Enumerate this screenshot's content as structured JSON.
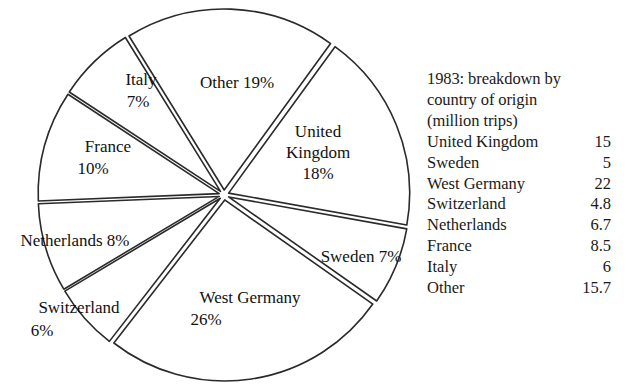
{
  "chart_data": {
    "type": "pie",
    "title": "1983: breakdown by country of origin (million trips)",
    "unit": "million trips",
    "year": "1983",
    "categories": [
      "United Kingdom",
      "Sweden",
      "West Germany",
      "Switzerland",
      "Netherlands",
      "France",
      "Italy",
      "Other"
    ],
    "values": [
      15,
      5,
      22,
      4.8,
      6.7,
      8.5,
      6,
      15.7
    ],
    "percentages": [
      18,
      7,
      26,
      6,
      8,
      10,
      7,
      19
    ],
    "value_labels": [
      "15",
      "5",
      "22",
      "4.8",
      "6.7",
      "8.5",
      "6",
      "15.7"
    ],
    "legend_position": "right",
    "exploded": true,
    "slice_label_text": [
      "United Kingdom 18%",
      "Sweden 7%",
      "West Germany 26%",
      "Switzerland 6%",
      "Netherlands 8%",
      "France 10%",
      "Italy 7%",
      "Other 19%"
    ]
  },
  "pie": {
    "slices": [
      {
        "name": "united-kingdom",
        "label_line1": "United",
        "label_line2": "Kingdom",
        "label_line3": "18%"
      },
      {
        "name": "sweden",
        "label_line1": "Sweden 7%",
        "label_line2": "",
        "label_line3": ""
      },
      {
        "name": "west-germany",
        "label_line1": "West Germany",
        "label_line2": "26%",
        "label_line3": ""
      },
      {
        "name": "switzerland",
        "label_line1": "Switzerland",
        "label_line2": "6%",
        "label_line3": ""
      },
      {
        "name": "netherlands",
        "label_line1": "Netherlands 8%",
        "label_line2": "",
        "label_line3": ""
      },
      {
        "name": "france",
        "label_line1": "France",
        "label_line2": "10%",
        "label_line3": ""
      },
      {
        "name": "italy",
        "label_line1": "Italy",
        "label_line2": "7%",
        "label_line3": ""
      },
      {
        "name": "other",
        "label_line1": "Other 19%",
        "label_line2": "",
        "label_line3": ""
      }
    ]
  },
  "legend": {
    "title": "1983: breakdown by\ncountry of origin\n(million trips)",
    "rows": [
      {
        "country": "United Kingdom",
        "value": "15"
      },
      {
        "country": "Sweden",
        "value": "5"
      },
      {
        "country": "West Germany",
        "value": "22"
      },
      {
        "country": "Switzerland",
        "value": "4.8"
      },
      {
        "country": "Netherlands",
        "value": "6.7"
      },
      {
        "country": "France",
        "value": "8.5"
      },
      {
        "country": "Italy",
        "value": "6"
      },
      {
        "country": "Other",
        "value": "15.7"
      }
    ]
  },
  "colors": {
    "background": "#ffffff",
    "stroke": "#2a2a2a",
    "text": "#111111",
    "slice_fill": "#ffffff"
  }
}
